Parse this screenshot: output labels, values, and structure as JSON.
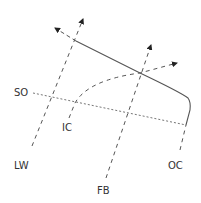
{
  "diagram": {
    "labels": {
      "so": "SO",
      "ic": "IC",
      "lw": "LW",
      "fb": "FB",
      "oc": "OC"
    },
    "colors": {
      "stroke": "#555555",
      "text": "#333333",
      "background": "#ffffff"
    },
    "lines": [
      {
        "id": "solid-curve",
        "style": "solid",
        "description": "Solid line from upper-left descending to the right then curving downward"
      },
      {
        "id": "so-line",
        "style": "dotted",
        "label": "SO"
      },
      {
        "id": "lw-line",
        "style": "dashed",
        "label": "LW",
        "arrow": true
      },
      {
        "id": "ic-line",
        "style": "dashed",
        "label": "IC",
        "arrow": true
      },
      {
        "id": "fb-line",
        "style": "dashed",
        "label": "FB",
        "arrow": true
      },
      {
        "id": "oc-line",
        "style": "dashed",
        "label": "OC"
      },
      {
        "id": "upper-left-extension",
        "style": "dashed",
        "arrow": true
      }
    ]
  }
}
